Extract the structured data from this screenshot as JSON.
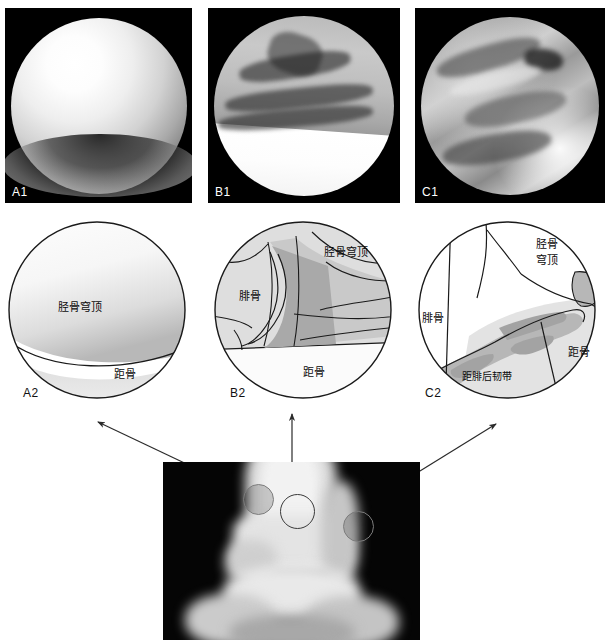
{
  "figure": {
    "panels": {
      "a1": {
        "tag": "A1",
        "kind": "arthroscopic-photo"
      },
      "b1": {
        "tag": "B1",
        "kind": "arthroscopic-photo"
      },
      "c1": {
        "tag": "C1",
        "kind": "arthroscopic-photo"
      },
      "a2": {
        "tag": "A2",
        "kind": "line-diagram"
      },
      "b2": {
        "tag": "B2",
        "kind": "line-diagram"
      },
      "c2": {
        "tag": "C2",
        "kind": "line-diagram"
      },
      "xray": {
        "tag": "",
        "kind": "ap-ankle-radiograph"
      }
    },
    "labels": {
      "tibial_plafond": "胫骨穹顶",
      "tibial_plafond_line1": "胫骨",
      "tibial_plafond_line2": "穹顶",
      "talus": "距骨",
      "fibula": "腓骨",
      "posterior_talofibular_ligament": "距腓后韧带"
    },
    "a2_labels": [
      "胫骨穹顶",
      "距骨"
    ],
    "b2_labels": [
      "胫骨穹顶",
      "腓骨",
      "距骨"
    ],
    "c2_labels": [
      "胫骨",
      "穹顶",
      "腓骨",
      "距骨",
      "距腓后韧带"
    ],
    "radiograph": {
      "portals": [
        {
          "name": "anteromedial-portal",
          "label": ""
        },
        {
          "name": "anterocentral-portal",
          "label": ""
        },
        {
          "name": "anterolateral-portal",
          "label": ""
        }
      ],
      "connector_count": 3
    },
    "colors": {
      "ink": "#0b0b0b",
      "outline": "#1a1a1a",
      "fill_light": "#eaeaea",
      "fill_mid": "#c9c9c9",
      "fill_dark": "#a8a8a8",
      "photo_background": "#000000",
      "page_background": "#ffffff"
    }
  }
}
